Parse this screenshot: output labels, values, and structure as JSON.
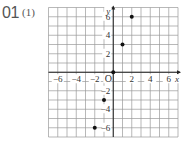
{
  "problem": {
    "number": "01",
    "subpart": "(1)"
  },
  "chart_data": {
    "type": "scatter",
    "title": "",
    "xlabel": "x",
    "ylabel": "y",
    "origin_label": "O",
    "xlim": [
      -7,
      7
    ],
    "ylim": [
      -7,
      7
    ],
    "grid": true,
    "x_ticks": [
      -6,
      -4,
      -2,
      2,
      4,
      6
    ],
    "y_ticks": [
      -6,
      -4,
      -2,
      2,
      4,
      6
    ],
    "x_tick_labels": [
      "−6",
      "−4",
      "−2",
      "2",
      "4",
      "6"
    ],
    "y_tick_labels": [
      "−6",
      "−4",
      "−2",
      "2",
      "4",
      "6"
    ],
    "points": [
      {
        "x": -2,
        "y": -6
      },
      {
        "x": -1,
        "y": -3
      },
      {
        "x": 0,
        "y": 0
      },
      {
        "x": 1,
        "y": 3
      },
      {
        "x": 2,
        "y": 6
      }
    ],
    "colors": {
      "grid": "#9a9a9a",
      "axis": "#222222",
      "point": "#111111"
    }
  }
}
